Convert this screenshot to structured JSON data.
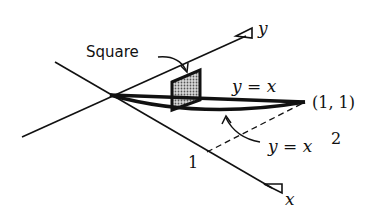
{
  "diagram": {
    "labels": {
      "y_axis": "y",
      "x_axis": "x",
      "square": "Square",
      "curve_line": "y = x",
      "curve_parabola": "y = x",
      "parabola_exponent": "2",
      "point": "(1, 1)",
      "tick_one": "1"
    },
    "colors": {
      "ink": "#111111",
      "square_fill": "#9a9a9a",
      "background": "#ffffff"
    }
  }
}
